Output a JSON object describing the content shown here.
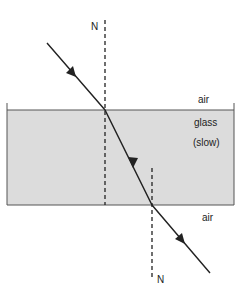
{
  "diagram": {
    "type": "refraction-through-glass-block",
    "labels": {
      "normal_top": "N",
      "normal_bottom": "N",
      "medium_top": "air",
      "medium_glass": "glass",
      "medium_glass_note": "(slow)",
      "medium_bottom": "air"
    },
    "colors": {
      "glass_fill": "#dcdcdc",
      "line": "#222222",
      "background": "#ffffff"
    }
  }
}
